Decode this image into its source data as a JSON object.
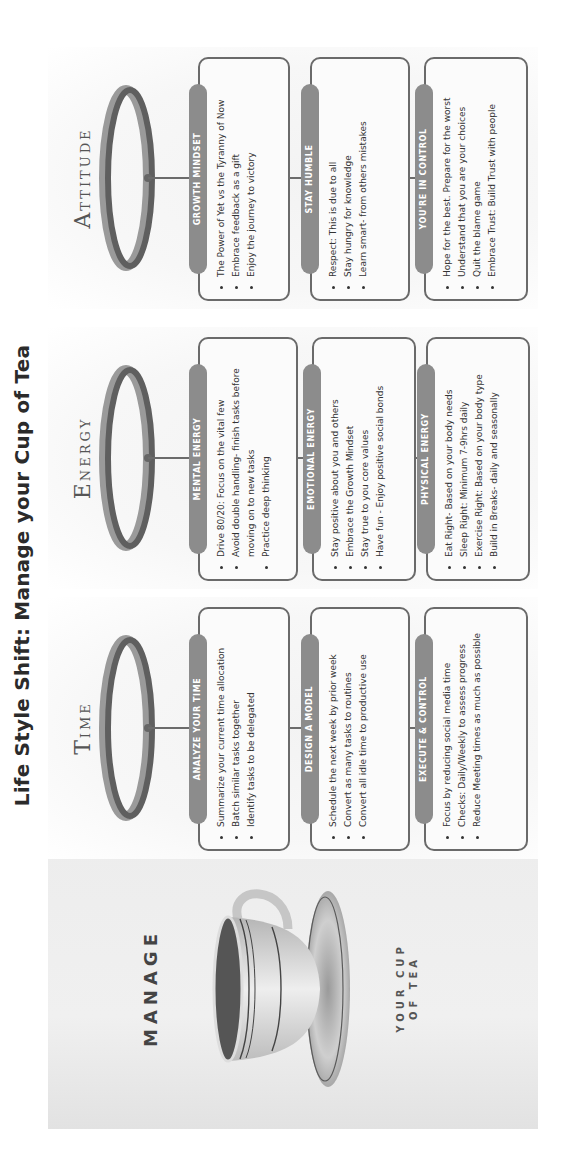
{
  "title": "Life Style Shift: Manage your Cup of Tea",
  "intro_panel": {
    "heading": "MANAGE",
    "subheading_line1": "YOUR CUP",
    "subheading_line2": "OF TEA",
    "image": "teacup-with-saucer"
  },
  "colors": {
    "pill_fill": "#8c8c8c",
    "card_border": "#6a6a6a",
    "ring_dark": "#5f5f5f",
    "ring_light": "#9a9a9a",
    "text": "#333333"
  },
  "columns": [
    {
      "heading_initial": "T",
      "heading_rest": "IME",
      "cards": [
        {
          "label": "ANALYZE YOUR TIME",
          "items": [
            "Summarize your current time allocation",
            "Batch similar tasks together",
            "Identify tasks to be delegated"
          ]
        },
        {
          "label": "DESIGN A MODEL",
          "items": [
            "Schedule the next week by prior week",
            "Convert as many tasks to routines",
            "Convert all idle time to productive use"
          ]
        },
        {
          "label": "EXECUTE & CONTROL",
          "items": [
            "Focus by reducing social media time",
            "Checks: Daily/Weekly to assess progress",
            "Reduce Meeting times as much as possible"
          ]
        }
      ]
    },
    {
      "heading_initial": "E",
      "heading_rest": "NERGY",
      "cards": [
        {
          "label": "MENTAL ENERGY",
          "items": [
            "Drive 80/20: Focus on the vital few",
            "Avoid double handling- finish tasks before moving on to new tasks",
            "Practice deep thinking"
          ]
        },
        {
          "label": "EMOTIONAL ENERGY",
          "items": [
            "Stay positive about you and others",
            "Embrace the Growth Mindset",
            "Stay true to you core values",
            "Have fun - Enjoy positive social bonds"
          ]
        },
        {
          "label": "PHYSICAL ENERGY",
          "items": [
            "Eat Right- Based on your body needs",
            "Sleep Right: Minimum 7-9hrs daily",
            "Exercise Right: Based on your body type",
            "Build in Breaks- daily and seasonally"
          ]
        }
      ]
    },
    {
      "heading_initial": "A",
      "heading_rest": "TTITUDE",
      "cards": [
        {
          "label": "GROWTH MINDSET",
          "items": [
            "The Power of Yet vs the Tyranny of Now",
            "Embrace feedback as a gift",
            "Enjoy the journey to victory"
          ]
        },
        {
          "label": "STAY HUMBLE",
          "items": [
            "Respect: This is due to all",
            "Stay hungry for knowledge",
            "Learn smart- from others mistakes"
          ]
        },
        {
          "label": "YOU'RE IN CONTROL",
          "items": [
            "Hope for the best. Prepare for the worst",
            "Understand that you are your choices",
            "Quit the blame game",
            "Embrace Trust: Build Trust with people"
          ]
        }
      ]
    }
  ]
}
